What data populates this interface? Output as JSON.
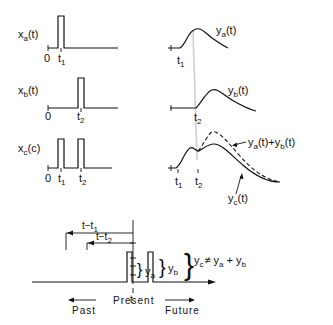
{
  "diagram": {
    "inputs": {
      "xa": {
        "name": "x",
        "sub": "a",
        "arg": "(t)",
        "origin": "0",
        "tick": "t",
        "tick_sub": "1"
      },
      "xb": {
        "name": "x",
        "sub": "b",
        "arg": "(t)",
        "origin": "0",
        "tick": "t",
        "tick_sub": "2"
      },
      "xc": {
        "name": "x",
        "sub": "c",
        "arg": "(c)",
        "origin": "0",
        "tick1": "t",
        "tick1_sub": "1",
        "tick2": "t",
        "tick2_sub": "2"
      }
    },
    "outputs": {
      "ya": {
        "name": "y",
        "sub": "a",
        "arg": "(t)",
        "tick": "t",
        "tick_sub": "1"
      },
      "yb": {
        "name": "y",
        "sub": "b",
        "arg": "(t)",
        "tick": "t",
        "tick_sub": "2"
      },
      "yc": {
        "name": "y",
        "sub": "c",
        "arg": "(t)",
        "tick1": "t",
        "tick1_sub": "1",
        "tick2": "t",
        "tick2_sub": "2"
      },
      "sum": {
        "a": "y",
        "a_sub": "a",
        "a_arg": "(t)",
        "plus": "+",
        "b": "y",
        "b_sub": "b",
        "b_arg": "(t)"
      }
    },
    "timeline": {
      "span1": "t−t",
      "span1_sub": "1",
      "span2": "t−t",
      "span2_sub": "2",
      "present_tick": "t",
      "present": "Present",
      "past": "Past",
      "future": "Future",
      "ya": "y",
      "ya_sub": "a",
      "yb": "y",
      "yb_sub": "b",
      "yc": "y",
      "yc_sub": "c",
      "neq": "≠",
      "rhs_a": "y",
      "rhs_a_sub": "a",
      "plus": "+",
      "rhs_b": "y",
      "rhs_b_sub": "b"
    }
  }
}
